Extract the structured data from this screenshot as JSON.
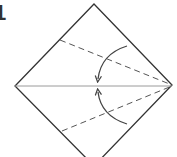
{
  "diagram": {
    "type": "origami-fold-step",
    "step_number": "1",
    "colors": {
      "outline": "#333333",
      "center_crease": "#9a9a9a",
      "fold_lines": "#555555",
      "arrows": "#444444",
      "background": "#ffffff"
    },
    "square": {
      "top": [
        94,
        4
      ],
      "right": [
        172,
        85
      ],
      "bottom": [
        94,
        166
      ],
      "left": [
        15,
        86
      ]
    },
    "center_crease": {
      "from": [
        15,
        86
      ],
      "to": [
        172,
        86
      ]
    },
    "valley_folds": [
      {
        "name": "upper-fold-line",
        "from": [
          60,
          40
        ],
        "to": [
          172,
          85
        ]
      },
      {
        "name": "lower-fold-line",
        "from": [
          62,
          131
        ],
        "to": [
          172,
          86
        ]
      }
    ],
    "arrows": [
      {
        "name": "fold-down-arrow",
        "start": [
          127,
          46
        ],
        "end": [
          98,
          80
        ]
      },
      {
        "name": "fold-up-arrow",
        "start": [
          127,
          124
        ],
        "end": [
          98,
          91
        ]
      }
    ]
  }
}
